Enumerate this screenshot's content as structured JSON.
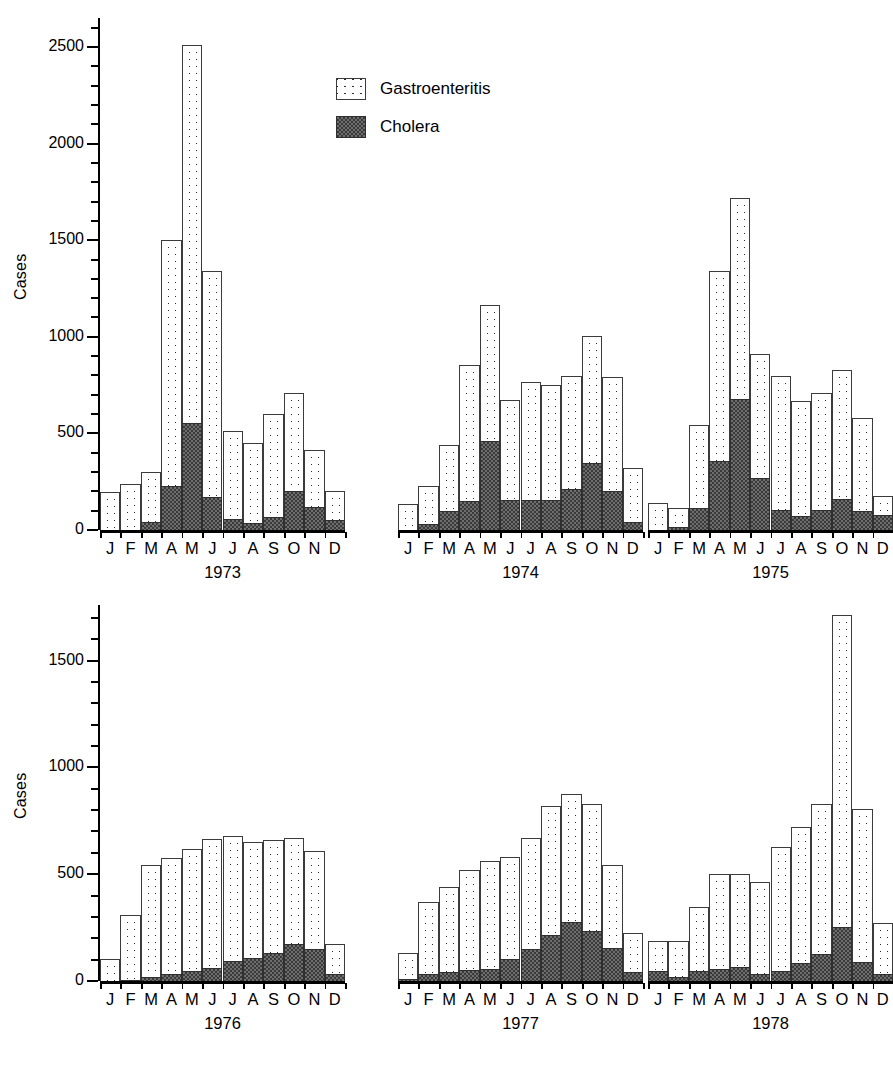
{
  "axis_label": "Cases",
  "legend": {
    "items": [
      {
        "label": "Gastroenteritis",
        "swatch": "gastroenteritis-swatch-icon",
        "color": "#ffffff"
      },
      {
        "label": "Cholera",
        "swatch": "cholera-swatch-icon",
        "color": "#6e6e6e"
      }
    ]
  },
  "months": [
    "J",
    "F",
    "M",
    "A",
    "M",
    "J",
    "J",
    "A",
    "S",
    "O",
    "N",
    "D"
  ],
  "rows": [
    {
      "name": "top-row",
      "ylabel": "Cases",
      "yticks": [
        0,
        500,
        1000,
        1500,
        2000,
        2500
      ],
      "ymax": 2650,
      "minor_step": 100,
      "panels": [
        "1973",
        "1974",
        "1975"
      ]
    },
    {
      "name": "bottom-row",
      "ylabel": "Cases",
      "yticks": [
        0,
        500,
        1000,
        1500
      ],
      "ymax": 1760,
      "minor_step": 100,
      "panels": [
        "1976",
        "1977",
        "1978"
      ]
    }
  ],
  "chart_data": {
    "type": "bar",
    "title": "",
    "subtitle": "",
    "xlabel": "",
    "ylabel": "Cases",
    "grid": false,
    "legend_position": "top-center",
    "stacked": true,
    "categories": [
      "J",
      "F",
      "M",
      "A",
      "M",
      "J",
      "J",
      "A",
      "S",
      "O",
      "N",
      "D"
    ],
    "panels": [
      {
        "year": "1973",
        "ylim": [
          0,
          2650
        ],
        "yticks": [
          0,
          500,
          1000,
          1500,
          2000,
          2500
        ],
        "series": [
          {
            "name": "Cholera",
            "values": [
              0,
              0,
              40,
              230,
              555,
              170,
              55,
              35,
              65,
              200,
              120,
              50
            ]
          },
          {
            "name": "Gastroenteritis",
            "values": [
              195,
              240,
              300,
              1500,
              2510,
              1340,
              515,
              450,
              600,
              710,
              415,
              200
            ]
          }
        ]
      },
      {
        "year": "1974",
        "ylim": [
          0,
          2650
        ],
        "yticks": [
          0,
          500,
          1000,
          1500,
          2000,
          2500
        ],
        "series": [
          {
            "name": "Cholera",
            "values": [
              0,
              30,
              100,
              150,
              460,
              155,
              155,
              155,
              210,
              345,
              200,
              40
            ]
          },
          {
            "name": "Gastroenteritis",
            "values": [
              135,
              230,
              440,
              855,
              1165,
              675,
              765,
              750,
              795,
              1005,
              790,
              320
            ]
          }
        ]
      },
      {
        "year": "1975",
        "ylim": [
          0,
          2650
        ],
        "yticks": [
          0,
          500,
          1000,
          1500,
          2000,
          2500
        ],
        "series": [
          {
            "name": "Cholera",
            "values": [
              0,
              15,
              115,
              355,
              680,
              270,
              105,
              70,
              105,
              160,
              100,
              80
            ]
          },
          {
            "name": "Gastroenteritis",
            "values": [
              140,
              115,
              545,
              1340,
              1720,
              910,
              795,
              670,
              710,
              830,
              580,
              175
            ]
          }
        ]
      },
      {
        "year": "1976",
        "ylim": [
          0,
          1760
        ],
        "yticks": [
          0,
          500,
          1000,
          1500
        ],
        "series": [
          {
            "name": "Cholera",
            "values": [
              0,
              5,
              20,
              35,
              45,
              60,
              95,
              110,
              130,
              175,
              150,
              35
            ]
          },
          {
            "name": "Gastroenteritis",
            "values": [
              105,
              310,
              545,
              575,
              620,
              665,
              680,
              650,
              660,
              670,
              610,
              175
            ]
          }
        ]
      },
      {
        "year": "1977",
        "ylim": [
          0,
          1760
        ],
        "yticks": [
          0,
          500,
          1000,
          1500
        ],
        "series": [
          {
            "name": "Cholera",
            "values": [
              10,
              35,
              40,
              50,
              55,
              105,
              150,
              215,
              275,
              235,
              155,
              40
            ]
          },
          {
            "name": "Gastroenteritis",
            "values": [
              130,
              370,
              440,
              520,
              560,
              580,
              670,
              820,
              875,
              830,
              545,
              225
            ]
          }
        ]
      },
      {
        "year": "1978",
        "ylim": [
          0,
          1760
        ],
        "yticks": [
          0,
          500,
          1000,
          1500
        ],
        "series": [
          {
            "name": "Cholera",
            "values": [
              45,
              20,
              45,
              55,
              65,
              35,
              45,
              85,
              125,
              255,
              90,
              35
            ]
          },
          {
            "name": "Gastroenteritis",
            "values": [
              185,
              185,
              345,
              500,
              500,
              465,
              625,
              720,
              830,
              1715,
              805,
              270
            ]
          }
        ]
      }
    ]
  }
}
